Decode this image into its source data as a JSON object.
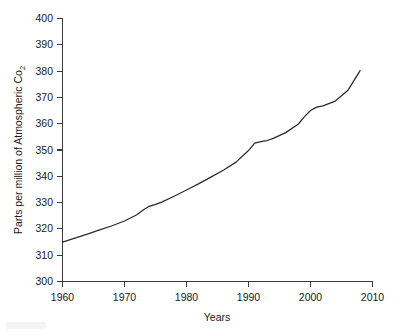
{
  "figure": {
    "background_color": "#ffffff",
    "line_color": "#2b2b2b",
    "axis_color": "#3a3a3a",
    "text_color": "#1a1a1a"
  },
  "axis_titles": {
    "y_main": "Parts per million of Atmospheric Co",
    "y_subscript": "2",
    "x": "Years"
  },
  "chart_data": {
    "type": "line",
    "title": "",
    "subtitle": "",
    "xlabel": "Years",
    "ylabel": "Parts per million of Atmospheric Co2",
    "xlim": [
      1960,
      2010
    ],
    "ylim": [
      300,
      400
    ],
    "xticks": [
      1960,
      1970,
      1980,
      1990,
      2000,
      2010
    ],
    "xtick_labels": [
      "1960",
      "1970",
      "1980",
      "1990",
      "2000",
      "2010"
    ],
    "yticks": [
      300,
      310,
      320,
      330,
      340,
      350,
      360,
      370,
      380,
      390,
      400
    ],
    "ytick_labels": [
      "300",
      "310",
      "320",
      "330",
      "340",
      "350",
      "360",
      "370",
      "380",
      "390",
      "400"
    ],
    "grid": false,
    "legend": false,
    "legend_position": "none",
    "annotations": [],
    "series": [
      {
        "name": "Atmospheric CO2 concentration",
        "color": "#2b2b2b",
        "x": [
          1960,
          1962,
          1964,
          1966,
          1968,
          1970,
          1972,
          1973,
          1974,
          1975,
          1976,
          1978,
          1980,
          1982,
          1984,
          1986,
          1988,
          1989,
          1990,
          1991,
          1992,
          1993,
          1994,
          1996,
          1998,
          1999,
          2000,
          2001,
          2002,
          2004,
          2006,
          2008
        ],
        "values": [
          315.0,
          316.5,
          318.0,
          319.6,
          321.2,
          323.0,
          325.4,
          327.2,
          328.6,
          329.3,
          330.2,
          332.4,
          334.8,
          337.2,
          339.8,
          342.4,
          345.4,
          347.6,
          349.8,
          352.6,
          353.2,
          353.6,
          354.4,
          356.6,
          359.8,
          362.6,
          365.0,
          366.3,
          366.8,
          368.6,
          372.6,
          380.2
        ]
      }
    ]
  }
}
